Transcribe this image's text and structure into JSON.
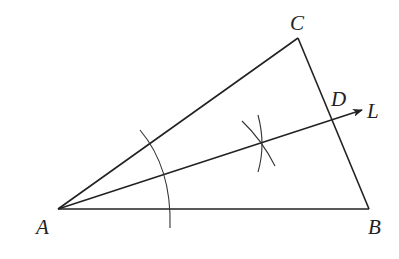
{
  "diagram": {
    "type": "geometric-construction",
    "points": {
      "A": {
        "label": "A",
        "x": 58,
        "y": 209
      },
      "B": {
        "label": "B",
        "x": 369,
        "y": 209
      },
      "C": {
        "label": "C",
        "x": 298,
        "y": 38
      },
      "D": {
        "label": "D",
        "x": 333,
        "y": 119
      },
      "L": {
        "label": "L",
        "x": 362,
        "y": 110
      }
    },
    "labels": {
      "A": "A",
      "B": "B",
      "C": "C",
      "D": "D",
      "L": "L"
    },
    "segments": [
      "AB",
      "BC",
      "CA"
    ],
    "ray": {
      "from": "A",
      "through": "D",
      "to": "L",
      "arrow": true
    },
    "arcs": [
      {
        "name": "construction-arc-centered-A",
        "center": "A"
      },
      {
        "name": "construction-arc-upper",
        "intersection": [
          262,
          142
        ]
      },
      {
        "name": "construction-arc-lower",
        "intersection": [
          262,
          142
        ]
      }
    ],
    "colors": {
      "stroke": "#222222",
      "background": "#ffffff"
    }
  }
}
